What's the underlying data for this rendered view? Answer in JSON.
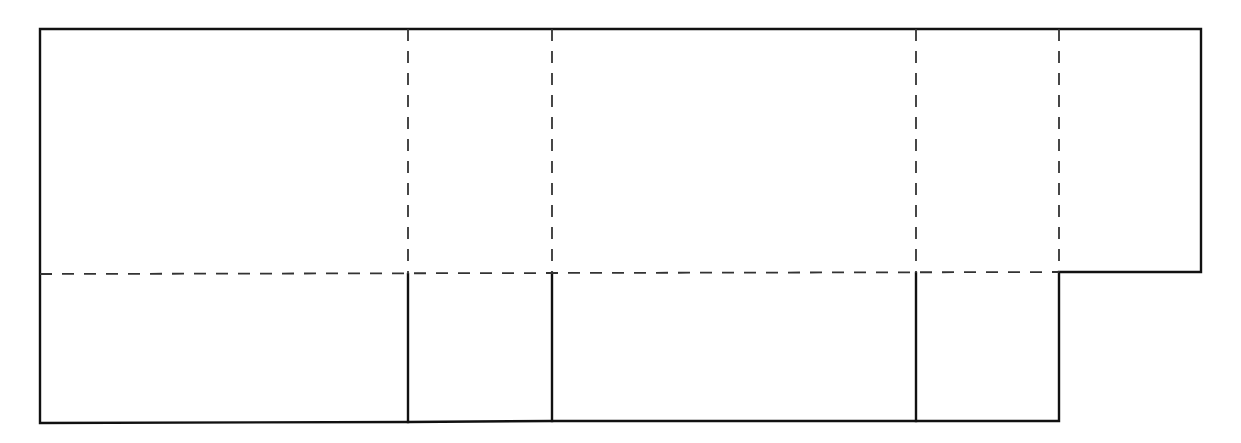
{
  "diagram": {
    "type": "box-net",
    "colors": {
      "background": "#ffffff",
      "cut_line": "#111111",
      "fold_line": "#333333"
    },
    "line_styles": {
      "cut": "solid",
      "fold": "dashed"
    },
    "outline_points": [
      [
        40,
        29
      ],
      [
        1201,
        29
      ],
      [
        1201,
        272
      ],
      [
        1059,
        272
      ],
      [
        1059,
        421
      ],
      [
        916,
        421
      ],
      [
        552,
        421
      ],
      [
        408,
        422
      ],
      [
        40,
        423
      ],
      [
        40,
        29
      ]
    ],
    "cut_segments": [
      {
        "name": "bottom-divider-1",
        "from": [
          408,
          274
        ],
        "to": [
          408,
          422
        ]
      },
      {
        "name": "bottom-divider-2",
        "from": [
          552,
          273
        ],
        "to": [
          552,
          421
        ]
      },
      {
        "name": "bottom-divider-3",
        "from": [
          916,
          273
        ],
        "to": [
          916,
          421
        ]
      }
    ],
    "fold_segments": [
      {
        "name": "vertical-fold-1",
        "from": [
          408,
          29
        ],
        "to": [
          408,
          274
        ]
      },
      {
        "name": "vertical-fold-2",
        "from": [
          552,
          29
        ],
        "to": [
          552,
          273
        ]
      },
      {
        "name": "vertical-fold-3",
        "from": [
          916,
          29
        ],
        "to": [
          916,
          273
        ]
      },
      {
        "name": "vertical-fold-4",
        "from": [
          1059,
          29
        ],
        "to": [
          1059,
          272
        ]
      },
      {
        "name": "horizontal-fold",
        "from": [
          40,
          274
        ],
        "to": [
          1059,
          272
        ]
      }
    ],
    "panels": {
      "top_row": [
        "side-panel-large-1",
        "end-panel-1",
        "side-panel-large-2",
        "end-panel-2",
        "glue-tab"
      ],
      "bottom_row": [
        "bottom-flap-1",
        "bottom-flap-2",
        "bottom-flap-3",
        "bottom-flap-4"
      ]
    }
  }
}
